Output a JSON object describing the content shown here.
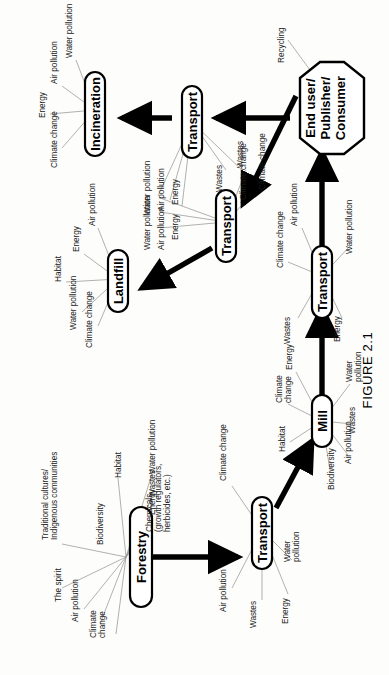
{
  "figure": {
    "caption": "FIGURE 2.1",
    "orientation": "rotated-90-ccw"
  },
  "nodes": {
    "forestry": {
      "label": "Forestry",
      "shape": "rounded-rect"
    },
    "transport_forestry_mill": {
      "label": "Transport",
      "shape": "rounded-rect"
    },
    "mill": {
      "label": "Mill",
      "shape": "rounded-rect"
    },
    "transport_mill_enduser": {
      "label": "Transport",
      "shape": "rounded-rect"
    },
    "end_user": {
      "label": "End user/\nPublisher/\nConsumer",
      "line1": "End user/",
      "line2": "Publisher/",
      "line3": "Consumer",
      "shape": "octagon"
    },
    "transport_enduser_waste": {
      "label": "Transport",
      "shape": "rounded-rect"
    },
    "transport_waste_incineration": {
      "label": "Transport",
      "shape": "rounded-rect"
    },
    "landfill": {
      "label": "Landfill",
      "shape": "rounded-rect"
    },
    "incineration": {
      "label": "Incineration",
      "shape": "rounded-rect"
    }
  },
  "leaves": {
    "forestry": [
      "Water pollution",
      "Wastes",
      "Energy",
      "Chemicals\n(growth regulators,\nherbicides, etc.)",
      "Habitat",
      "Biodiversity",
      "Traditional cultures/\nIndigenous communities",
      "The spirit",
      "Air pollution",
      "Climate\nchange"
    ],
    "transport_forestry_mill": [
      "Climate change",
      "Air pollution",
      "Wastes",
      "Energy",
      "Water\npollution"
    ],
    "mill": [
      "Energy",
      "Climate\nchange",
      "Habitat",
      "Biodiversity",
      "Air pollution",
      "Wastes",
      "Water\npollution"
    ],
    "transport_mill_enduser": [
      "Air pollution",
      "Climate change",
      "Wastes",
      "Energy",
      "Water pollution"
    ],
    "end_user": [
      "Recycling"
    ],
    "transport_enduser_waste": [
      "Water pollution",
      "Air pollution",
      "Energy",
      "Wastes",
      "Climate change"
    ],
    "transport_waste_incineration": [
      "Water pollution",
      "Air pollution",
      "Energy",
      "Wastes",
      "Climate change"
    ],
    "landfill": [
      "Air pollution",
      "Energy",
      "Habitat",
      "Water pollution",
      "Climate change"
    ],
    "incineration": [
      "Water pollution",
      "Air pollution",
      "Energy",
      "Climate change"
    ]
  },
  "flow": [
    {
      "from": "Forestry",
      "to": "Transport"
    },
    {
      "from": "Transport",
      "to": "Mill"
    },
    {
      "from": "Mill",
      "to": "Transport"
    },
    {
      "from": "Transport",
      "to": "End user/Publisher/Consumer"
    },
    {
      "from": "End user/Publisher/Consumer",
      "to": "Transport"
    },
    {
      "from": "Transport",
      "to": "Landfill"
    },
    {
      "from": "End user/Publisher/Consumer",
      "to": "Transport"
    },
    {
      "from": "Transport",
      "to": "Incineration"
    }
  ],
  "colors": {
    "ink": "#000000",
    "leaf_line": "#8a8a8a",
    "paper": "#fdfdfb"
  }
}
